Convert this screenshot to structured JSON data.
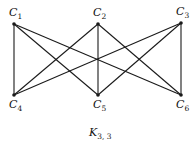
{
  "diagram": {
    "title": "K",
    "title_sub": "3, 3",
    "nodes": [
      {
        "id": "C1",
        "base": "C",
        "sub": "1",
        "x": 14,
        "y": 24
      },
      {
        "id": "C2",
        "base": "C",
        "sub": "2",
        "x": 98,
        "y": 24
      },
      {
        "id": "C3",
        "base": "C",
        "sub": "3",
        "x": 181,
        "y": 23
      },
      {
        "id": "C4",
        "base": "C",
        "sub": "4",
        "x": 14,
        "y": 95
      },
      {
        "id": "C5",
        "base": "C",
        "sub": "5",
        "x": 98,
        "y": 95
      },
      {
        "id": "C6",
        "base": "C",
        "sub": "6",
        "x": 181,
        "y": 95
      }
    ],
    "edges": [
      [
        "C1",
        "C4"
      ],
      [
        "C1",
        "C5"
      ],
      [
        "C1",
        "C6"
      ],
      [
        "C2",
        "C4"
      ],
      [
        "C2",
        "C5"
      ],
      [
        "C2",
        "C6"
      ],
      [
        "C3",
        "C4"
      ],
      [
        "C3",
        "C5"
      ],
      [
        "C3",
        "C6"
      ]
    ]
  }
}
